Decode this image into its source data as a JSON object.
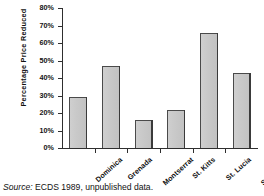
{
  "chart_data": {
    "type": "bar",
    "title": "",
    "xlabel": "",
    "ylabel": "Percentage Price Reduced",
    "categories": [
      "Dominica",
      "Grenada",
      "Montserrat",
      "St. Kitts",
      "St. Lucia",
      "St. Vincent"
    ],
    "values": [
      29,
      47,
      16,
      22,
      66,
      43
    ],
    "ylim": [
      0,
      80
    ],
    "ytick_values": [
      0,
      10,
      20,
      30,
      40,
      50,
      60,
      70,
      80
    ],
    "ytick_labels": [
      "0%",
      "10%",
      "20%",
      "30%",
      "40%",
      "50%",
      "60%",
      "70%",
      "80%"
    ],
    "grid": false,
    "legend": false,
    "legend_position": "none",
    "bar_fill_color": "#c9c9c9",
    "bar_edge_color": "#4a4a4a",
    "axis_color": "#2e2e2e",
    "background_color": "#ffffff"
  },
  "caption": {
    "source_word": "Source:",
    "text": " ECDS 1989, unpublished data."
  }
}
